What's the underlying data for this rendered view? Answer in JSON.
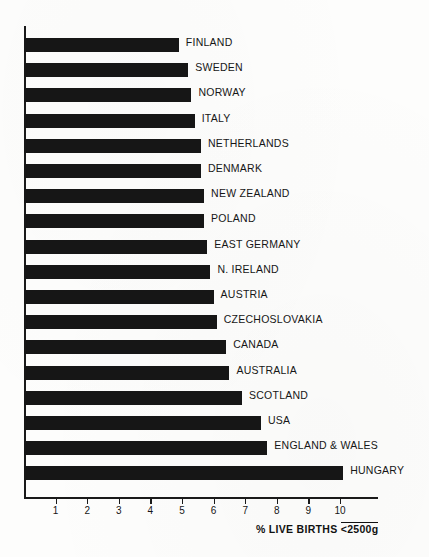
{
  "chart_data": {
    "type": "bar",
    "orientation": "horizontal",
    "title": "",
    "xlabel": "% LIVE BIRTHS <2500g",
    "ylabel": "",
    "xlim": [
      0,
      11.2
    ],
    "grid": false,
    "legend": false,
    "categories": [
      "FINLAND",
      "SWEDEN",
      "NORWAY",
      "ITALY",
      "NETHERLANDS",
      "DENMARK",
      "NEW ZEALAND",
      "POLAND",
      "EAST GERMANY",
      "N. IRELAND",
      "AUSTRIA",
      "CZECHOSLOVAKIA",
      "CANADA",
      "AUSTRALIA",
      "SCOTLAND",
      "USA",
      "ENGLAND & WALES",
      "HUNGARY"
    ],
    "values": [
      4.9,
      5.2,
      5.3,
      5.4,
      5.6,
      5.6,
      5.7,
      5.7,
      5.8,
      5.9,
      6.0,
      6.1,
      6.4,
      6.5,
      6.9,
      7.5,
      7.7,
      10.1
    ],
    "xticks": [
      1,
      2,
      3,
      4,
      5,
      6,
      7,
      8,
      9,
      10
    ],
    "xticklabels": [
      "1",
      "2",
      "3",
      "4",
      "5",
      "6",
      "7",
      "8",
      "9",
      "10"
    ],
    "bar_color": "#161616",
    "axis_color": "#1a1a1a",
    "background_color": "#fdfdfc"
  },
  "axis": {
    "x_title_prefix": "% LIVE BIRTHS ",
    "x_title_unit": "<2500g"
  }
}
